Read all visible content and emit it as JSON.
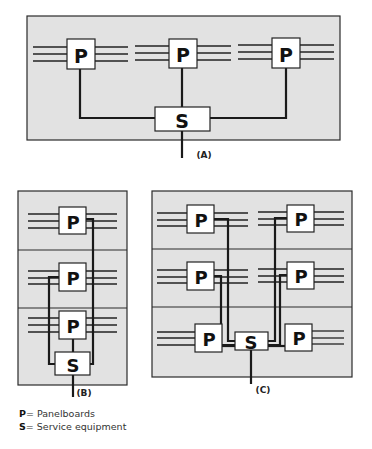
{
  "diagrams": {
    "a": {
      "caption": "(A)",
      "panel_label": "P",
      "service_label": "S"
    },
    "b": {
      "caption": "(B)",
      "panel_label": "P",
      "service_label": "S"
    },
    "c": {
      "caption": "(C)",
      "panel_label": "P",
      "service_label": "S"
    }
  },
  "legend": {
    "items": [
      {
        "key": "P",
        "sep": "= ",
        "text": "Panelboards"
      },
      {
        "key": "S",
        "sep": "= ",
        "text": "Service equipment"
      }
    ]
  },
  "colors": {
    "panel_fill": "#e2e2e2",
    "line": "#1a1a1a",
    "box_fill": "#ffffff"
  }
}
